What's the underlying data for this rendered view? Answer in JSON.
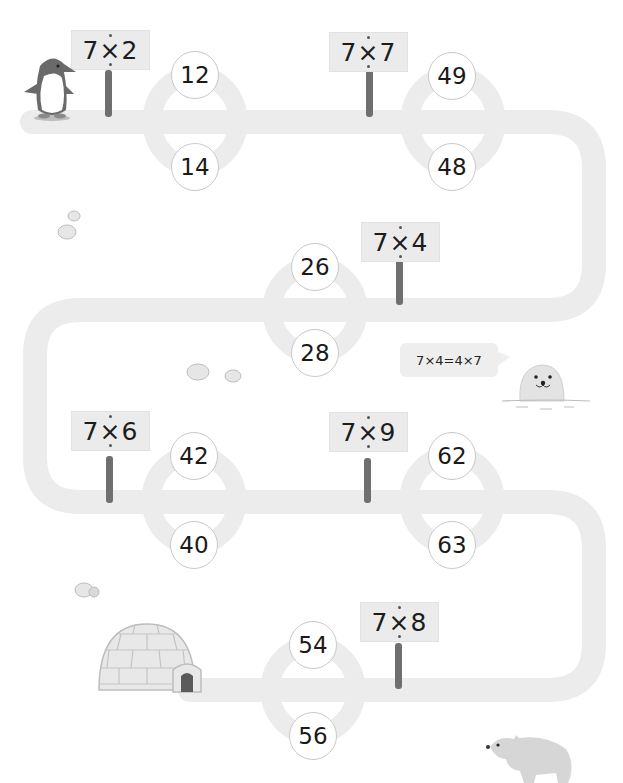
{
  "puzzle": {
    "colors": {
      "path": "#ececec",
      "sign": "#ebebeb",
      "post": "#6f6f6f",
      "text": "#1a1a1a",
      "circle_border": "#c9c9c9"
    },
    "stops": [
      {
        "sign": "7×2",
        "answers": [
          "12",
          "14"
        ]
      },
      {
        "sign": "7×7",
        "answers": [
          "49",
          "48"
        ]
      },
      {
        "sign": "7×4",
        "answers": [
          "26",
          "28"
        ]
      },
      {
        "sign": "7×6",
        "answers": [
          "42",
          "40"
        ]
      },
      {
        "sign": "7×9",
        "answers": [
          "62",
          "63"
        ]
      },
      {
        "sign": "7×8",
        "answers": [
          "54",
          "56"
        ]
      }
    ],
    "hint_bubble": "7×4=4×7",
    "characters": [
      "penguin-icon",
      "seal-icon",
      "igloo-icon",
      "polar-bear-icon",
      "snow-rock-icon"
    ]
  }
}
